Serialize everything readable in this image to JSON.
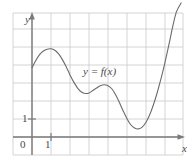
{
  "figure": {
    "kind": "cartesian-graph",
    "width": 196,
    "height": 167,
    "background_color": "#ffffff"
  },
  "axes": {
    "y_axis_label": "y",
    "x_axis_label": "x",
    "origin_label": "0",
    "x_tick_label": "1",
    "y_tick_label": "1",
    "axis_color": "#7a7a7a",
    "grid_color": "#c9c9c9",
    "grid_visible": true
  },
  "curve": {
    "label": "y = f(x)",
    "color": "#6b6b6b",
    "stroke_width": 1.1
  },
  "chart_data": {
    "type": "line",
    "title": "",
    "subtitle": "",
    "xlabel": "x",
    "ylabel": "y",
    "grid": true,
    "legend": "none",
    "annotations": [
      "y = f(x)"
    ],
    "xlim": [
      -1,
      8
    ],
    "ylim": [
      -0.6,
      7.5
    ],
    "xticks": [
      0,
      1
    ],
    "xticklabels": [
      "0",
      "1"
    ],
    "yticks": [
      1
    ],
    "yticklabels": [
      "1"
    ],
    "series": [
      {
        "name": "f",
        "x": [
          0.0,
          0.2,
          0.4,
          0.6,
          0.8,
          1.0,
          1.2,
          1.4,
          1.6,
          1.8,
          2.0,
          2.2,
          2.4,
          2.6,
          2.8,
          3.0,
          3.2,
          3.4,
          3.6,
          3.8,
          4.0,
          4.2,
          4.4,
          4.6,
          4.8,
          5.0,
          5.2,
          5.4,
          5.6,
          5.8,
          6.0,
          6.2,
          6.4,
          6.6,
          6.8,
          7.0,
          7.2,
          7.4,
          7.6,
          7.85
        ],
        "y": [
          3.85,
          4.25,
          4.58,
          4.78,
          4.88,
          4.9,
          4.82,
          4.62,
          4.3,
          3.9,
          3.45,
          3.05,
          2.72,
          2.5,
          2.42,
          2.45,
          2.58,
          2.72,
          2.85,
          2.9,
          2.85,
          2.68,
          2.35,
          1.92,
          1.45,
          1.02,
          0.68,
          0.5,
          0.45,
          0.55,
          0.82,
          1.25,
          1.82,
          2.5,
          3.28,
          4.15,
          5.1,
          6.1,
          6.95,
          7.45
        ]
      }
    ],
    "features": {
      "local_max_1": {
        "x": 1.0,
        "y": 4.9
      },
      "local_min_1": {
        "x": 2.8,
        "y": 2.42
      },
      "local_max_2": {
        "x": 3.8,
        "y": 2.9
      },
      "local_min_2": {
        "x": 5.6,
        "y": 0.45
      }
    }
  }
}
